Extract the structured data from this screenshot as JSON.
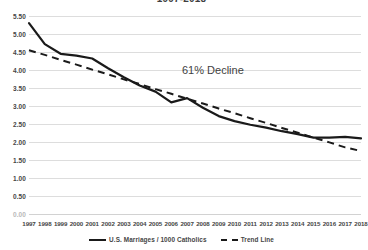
{
  "chart_data": {
    "type": "line",
    "title": "1997-2018",
    "xlabel": "",
    "ylabel": "",
    "ylim": [
      0.0,
      5.5
    ],
    "ytick_step": 0.5,
    "grid": true,
    "legend_position": "bottom",
    "categories": [
      "1997",
      "1998",
      "1999",
      "2000",
      "2001",
      "2002",
      "2003",
      "2004",
      "2005",
      "2006",
      "2007",
      "2008",
      "2009",
      "2010",
      "2011",
      "2012",
      "2013",
      "2014",
      "2015",
      "2016",
      "2017",
      "2018"
    ],
    "yticks": [
      "0.00",
      "0.50",
      "1.00",
      "1.50",
      "2.00",
      "2.50",
      "3.00",
      "3.50",
      "4.00",
      "4.50",
      "5.00",
      "5.50"
    ],
    "series": [
      {
        "name": "U.S. Marriages / 1000 Catholics",
        "style": "solid",
        "color": "#1a1a1a",
        "values": [
          5.3,
          4.72,
          4.45,
          4.4,
          4.32,
          4.05,
          3.8,
          3.57,
          3.4,
          3.1,
          3.22,
          2.95,
          2.72,
          2.58,
          2.48,
          2.4,
          2.3,
          2.22,
          2.12,
          2.12,
          2.14,
          2.1
        ]
      },
      {
        "name": "Trend Line",
        "style": "dashed",
        "color": "#1a1a1a",
        "values": [
          4.55,
          4.42,
          4.28,
          4.15,
          4.01,
          3.88,
          3.74,
          3.61,
          3.47,
          3.34,
          3.2,
          3.07,
          2.93,
          2.8,
          2.66,
          2.53,
          2.39,
          2.26,
          2.12,
          1.99,
          1.85,
          1.75
        ]
      }
    ],
    "annotations": [
      {
        "text": "61% Decline"
      }
    ]
  },
  "legend": {
    "items": [
      {
        "label": "U.S. Marriages / 1000 Catholics"
      },
      {
        "label": "Trend Line"
      }
    ]
  }
}
